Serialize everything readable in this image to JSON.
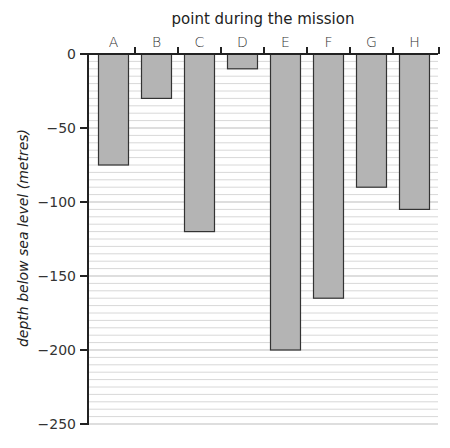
{
  "chart_data": {
    "type": "bar",
    "title": "point during the mission",
    "xlabel": "point during the mission",
    "ylabel": "depth below sea level (metres)",
    "categories": [
      "A",
      "B",
      "C",
      "D",
      "E",
      "F",
      "G",
      "H"
    ],
    "values": [
      -75,
      -30,
      -120,
      -10,
      -200,
      -165,
      -90,
      -105
    ],
    "ylim": [
      -250,
      0
    ],
    "yticks": [
      0,
      -50,
      -100,
      -150,
      -200,
      -250
    ],
    "ytick_labels": [
      "0",
      "-50",
      "-100",
      "-150",
      "-200",
      "-250"
    ],
    "minor_grid_step": 5,
    "grid": true,
    "x_axis_position": "top",
    "legend": null
  },
  "colors": {
    "bar_fill": "#b4b4b4",
    "bar_stroke": "#333333",
    "grid_minor": "#d8d8d8",
    "grid_major": "#bdbdbd",
    "axis": "#222222"
  }
}
